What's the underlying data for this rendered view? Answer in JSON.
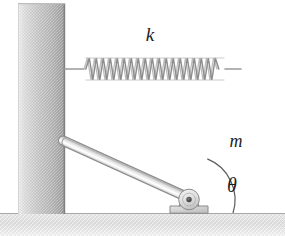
{
  "figure": {
    "kind": "physics-free-body-diagram",
    "background_color": "#ffffff",
    "width": 285,
    "height": 236
  },
  "labels": {
    "spring_constant": "k",
    "rod_mass": "m",
    "angle": "θ"
  },
  "colors": {
    "background": "#ffffff",
    "wall_light": "#e8e8e8",
    "wall_mid": "#c9c9c9",
    "wall_dark": "#a9a9a9",
    "wall_edge": "#8f8f8f",
    "ground_fill": "#e2e2e2",
    "ground_line": "#a8a8a8",
    "spring_wire": "#9a9a9a",
    "rod_light": "#f2f2f2",
    "rod_mid": "#d2d2d2",
    "rod_edge": "#8a8a8a",
    "pivot_fill": "#e4e4e4",
    "pivot_edge": "#8b8b8b",
    "pivot_pin": "#4a4a4a",
    "arc_stroke": "#5a5a5a",
    "text": "#1d1d1d"
  },
  "geometry": {
    "wall": {
      "x": 18,
      "y": 3,
      "width": 47,
      "height": 210
    },
    "ground": {
      "y_top": 213,
      "height": 23
    },
    "spring": {
      "left_anchor_x": 64,
      "right_anchor_x": 240,
      "center_y": 69,
      "coil_count": 20,
      "coil_amplitude": 12
    },
    "rod": {
      "top_x": 244,
      "top_y": 66,
      "pivot_x": 189,
      "pivot_y": 198,
      "thickness": 9,
      "angle_degrees": 65
    },
    "pivot": {
      "center_x": 189,
      "center_y": 198,
      "radius": 10
    },
    "angle_arc": {
      "center_x": 189,
      "center_y": 199,
      "radius": 44
    }
  }
}
